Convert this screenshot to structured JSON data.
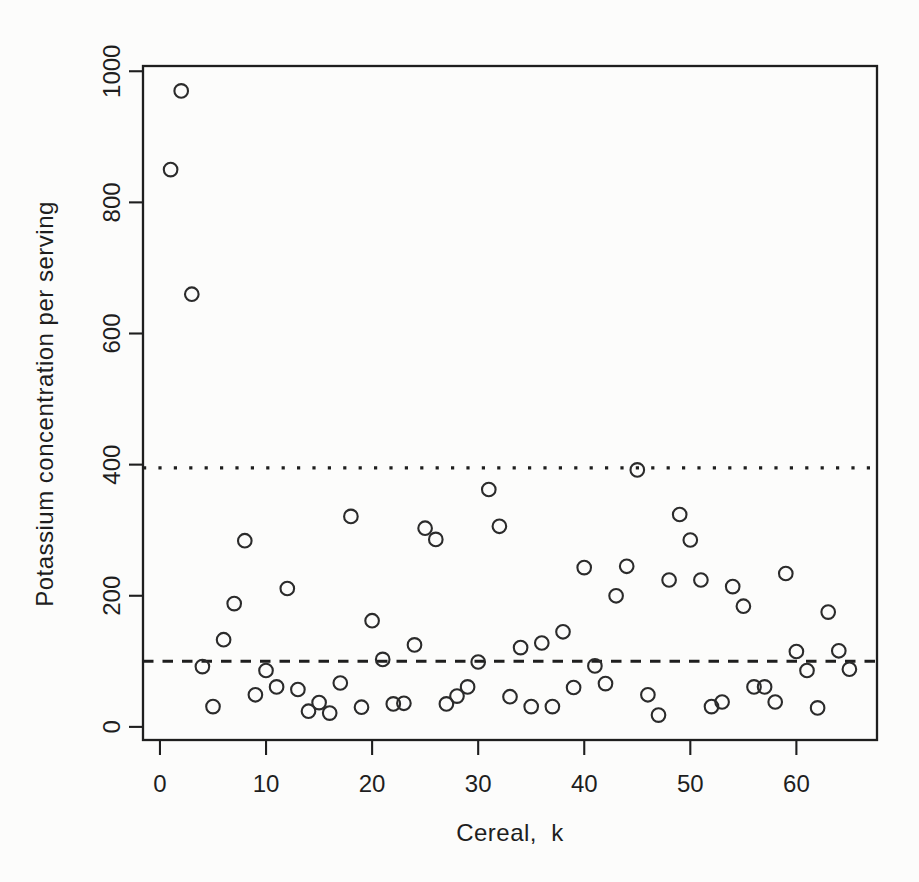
{
  "figure": {
    "background": "#fcfcfb",
    "ink_color": "#1e1e1e",
    "point_color": "#2b2b2b"
  },
  "chart_data": {
    "type": "scatter",
    "title": "",
    "xlabel": "Cereal,  k",
    "ylabel": "Potassium concentration per serving",
    "marker": "open-circle",
    "grid": "off",
    "legend": "none",
    "xlim": [
      -1.6,
      67.6
    ],
    "ylim": [
      -20,
      1008
    ],
    "x_ticks": [
      0,
      10,
      20,
      30,
      40,
      50,
      60
    ],
    "y_ticks": [
      0,
      200,
      400,
      600,
      800,
      1000
    ],
    "reference_lines": [
      {
        "name": "upper-dotted-line",
        "style": "dotted",
        "y": 395
      },
      {
        "name": "lower-dashed-line",
        "style": "dashed",
        "y": 100
      }
    ],
    "x": [
      1,
      2,
      3,
      4,
      5,
      6,
      7,
      8,
      9,
      10,
      11,
      12,
      13,
      14,
      15,
      16,
      17,
      18,
      19,
      20,
      21,
      22,
      23,
      24,
      25,
      26,
      27,
      28,
      29,
      30,
      31,
      32,
      33,
      34,
      35,
      36,
      37,
      38,
      39,
      40,
      41,
      42,
      43,
      44,
      45,
      46,
      47,
      48,
      49,
      50,
      51,
      52,
      53,
      54,
      55,
      56,
      57,
      58,
      59,
      60,
      61,
      62,
      63,
      64,
      65
    ],
    "y": [
      850,
      970,
      660,
      92,
      31,
      133,
      188,
      284,
      49,
      86,
      61,
      211,
      57,
      24,
      37,
      21,
      67,
      321,
      30,
      162,
      103,
      35,
      36,
      125,
      303,
      286,
      35,
      47,
      61,
      99,
      362,
      306,
      46,
      121,
      31,
      128,
      31,
      145,
      60,
      243,
      93,
      66,
      200,
      245,
      392,
      49,
      18,
      224,
      324,
      285,
      224,
      31,
      38,
      214,
      184,
      61,
      61,
      38,
      234,
      115,
      86,
      29,
      175,
      116,
      88
    ]
  }
}
